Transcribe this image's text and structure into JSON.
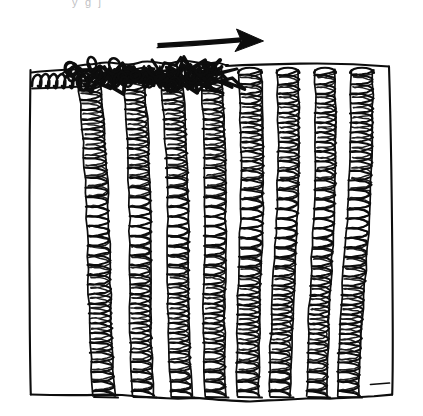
{
  "figure": {
    "title": "Transverse wave pulse travelling along a row of coil springs",
    "style": "hand-drawn ink line sketch, black on white",
    "clipped_caption_fragment": "y   g        j",
    "background_color": "#ffffff",
    "ink_color": "#0d0d0d"
  },
  "arrow": {
    "name": "direction-arrow",
    "label": "wave direction",
    "points": "right",
    "x_start": 157,
    "x_end": 263,
    "y": 41,
    "shaft_width": 4.6,
    "head_length": 26,
    "head_half_height": 13,
    "color": "#0d0d0d"
  },
  "board": {
    "name": "spring-board",
    "left_x": 29,
    "right_x": 393,
    "top_y": 62,
    "bottom_y": 398,
    "description": "slab drawn as a slightly skewed quadrilateral with wavy hand-drawn top and bottom edges"
  },
  "springs": {
    "count": 8,
    "coil_count_per_spring": 34,
    "top_y": 70,
    "bottom_y": 396,
    "items": [
      {
        "index": 1,
        "name": "spring-1",
        "cx": 88,
        "width": 22,
        "top_state": "tangled",
        "density": "high",
        "tilt": 3
      },
      {
        "index": 2,
        "name": "spring-2",
        "cx": 133,
        "width": 21,
        "top_state": "tangled",
        "density": "high",
        "tilt": 2
      },
      {
        "index": 3,
        "name": "spring-3",
        "cx": 171,
        "width": 21,
        "top_state": "tangled",
        "density": "high",
        "tilt": 2
      },
      {
        "index": 4,
        "name": "spring-4",
        "cx": 211,
        "width": 21,
        "top_state": "tangled",
        "density": "high",
        "tilt": 1
      },
      {
        "index": 5,
        "name": "spring-5",
        "cx": 250,
        "width": 22,
        "top_state": "open",
        "density": "medium",
        "tilt": 0
      },
      {
        "index": 6,
        "name": "spring-6",
        "cx": 288,
        "width": 21,
        "top_state": "open",
        "density": "medium",
        "tilt": -1
      },
      {
        "index": 7,
        "name": "spring-7",
        "cx": 325,
        "width": 20,
        "top_state": "open",
        "density": "medium",
        "tilt": -1
      },
      {
        "index": 8,
        "name": "spring-8",
        "cx": 362,
        "width": 22,
        "top_state": "open",
        "density": "medium",
        "tilt": -2
      }
    ]
  },
  "lying_coil": {
    "name": "horizontal-coil",
    "x_start": 32,
    "x_end": 92,
    "y": 77,
    "height": 17,
    "loops": 9,
    "description": "a coil lying flat along the top-left edge of the board"
  },
  "scribble_band": {
    "name": "compressed-coil-band",
    "x_start": 68,
    "x_end": 226,
    "y_top": 60,
    "y_bottom": 92,
    "description": "heavy overdrawn tangle where the left-hand springs are bunched together"
  }
}
